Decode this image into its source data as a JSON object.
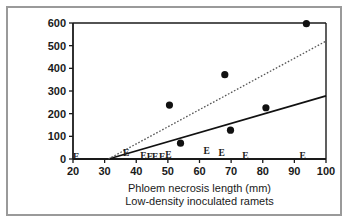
{
  "figure": {
    "border_color": "#9a9a9a",
    "background": "#ffffff",
    "ink_color": "#1a1a1a"
  },
  "chart_data": {
    "type": "scatter",
    "title": "",
    "xlabel": "Phloem necrosis length (mm)",
    "sublabel": "Low-density inoculated ramets",
    "ylabel": "",
    "xlim": [
      20,
      100
    ],
    "ylim": [
      0,
      600
    ],
    "xticks": [
      20,
      30,
      40,
      50,
      60,
      70,
      80,
      90,
      100
    ],
    "yticks": [
      0,
      100,
      200,
      300,
      400,
      500,
      600
    ],
    "xtick_labels": [
      "20",
      "30",
      "40",
      "50",
      "60",
      "70",
      "80",
      "90",
      "100"
    ],
    "ytick_labels": [
      "0",
      "100",
      "200",
      "300",
      "400",
      "500",
      "600"
    ],
    "grid": false,
    "legend": "none",
    "series": [
      {
        "name": "filled-circle-points",
        "marker": "filled-circle",
        "color": "#111111",
        "points": [
          {
            "x": 50.5,
            "y": 238
          },
          {
            "x": 54.0,
            "y": 70
          },
          {
            "x": 68.0,
            "y": 372
          },
          {
            "x": 69.8,
            "y": 127
          },
          {
            "x": 81.0,
            "y": 226
          },
          {
            "x": 93.8,
            "y": 597
          }
        ]
      },
      {
        "name": "E-markers",
        "marker": "letter-E",
        "color": "#1a1a1a",
        "points": [
          {
            "x": 21.0,
            "y": 8
          },
          {
            "x": 36.8,
            "y": 26
          },
          {
            "x": 42.3,
            "y": 12
          },
          {
            "x": 44.3,
            "y": 8
          },
          {
            "x": 46.0,
            "y": 8
          },
          {
            "x": 48.2,
            "y": 8
          },
          {
            "x": 50.2,
            "y": 16
          },
          {
            "x": 62.3,
            "y": 36
          },
          {
            "x": 67.0,
            "y": 28
          },
          {
            "x": 74.5,
            "y": 14
          },
          {
            "x": 92.6,
            "y": 14
          }
        ]
      }
    ],
    "fit_lines": [
      {
        "name": "solid-regression-line",
        "style": "solid",
        "color": "#111111",
        "x0": 31.2,
        "y0": 0,
        "x1": 100,
        "y1": 278
      },
      {
        "name": "dotted-regression-line",
        "style": "dotted",
        "color": "#555555",
        "x0": 31.2,
        "y0": 0,
        "x1": 100,
        "y1": 520
      }
    ]
  }
}
